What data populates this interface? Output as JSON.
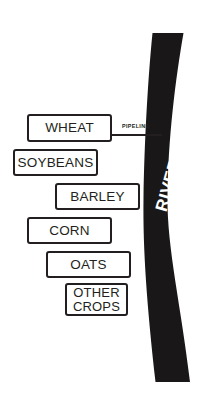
{
  "diagram": {
    "background_color": "#ffffff",
    "river": {
      "label": "RIVER",
      "color": "#1a1718",
      "label_color": "#ffffff"
    },
    "pipeline": {
      "label": "PIPELINE",
      "color": "#231f20"
    },
    "crops": [
      {
        "label": "WHEAT",
        "name": "crop-box-wheat"
      },
      {
        "label": "SOYBEANS",
        "name": "crop-box-soybeans"
      },
      {
        "label": "BARLEY",
        "name": "crop-box-barley"
      },
      {
        "label": "CORN",
        "name": "crop-box-corn"
      },
      {
        "label": "OATS",
        "name": "crop-box-oats"
      },
      {
        "label": "OTHER\nCROPS",
        "name": "crop-box-other-crops"
      }
    ]
  }
}
